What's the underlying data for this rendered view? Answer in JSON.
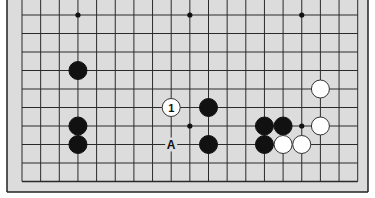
{
  "diagram": {
    "type": "go-board-fragment",
    "board_color": "#dcdcdc",
    "line_color": "#2a2a2a",
    "columns": 19,
    "rows": 10,
    "origin_x": 22,
    "origin_y": 15,
    "spacing_x": 18.65,
    "spacing_y": 18.5,
    "star_points": [
      [
        3,
        0
      ],
      [
        9,
        0
      ],
      [
        15,
        0
      ],
      [
        9,
        6
      ],
      [
        15,
        6
      ]
    ],
    "stones": [
      {
        "col": 3,
        "row": 3,
        "color": "black"
      },
      {
        "col": 3,
        "row": 6,
        "color": "black"
      },
      {
        "col": 3,
        "row": 7,
        "color": "black"
      },
      {
        "col": 8,
        "row": 5,
        "color": "white",
        "label": "1"
      },
      {
        "col": 10,
        "row": 5,
        "color": "black"
      },
      {
        "col": 10,
        "row": 7,
        "color": "black"
      },
      {
        "col": 13,
        "row": 6,
        "color": "black"
      },
      {
        "col": 14,
        "row": 6,
        "color": "black"
      },
      {
        "col": 13,
        "row": 7,
        "color": "black"
      },
      {
        "col": 14,
        "row": 7,
        "color": "white"
      },
      {
        "col": 15,
        "row": 7,
        "color": "white"
      },
      {
        "col": 16,
        "row": 6,
        "color": "white"
      },
      {
        "col": 16,
        "row": 4,
        "color": "white"
      }
    ],
    "markers": [
      {
        "col": 8,
        "row": 7,
        "label": "A"
      }
    ]
  }
}
